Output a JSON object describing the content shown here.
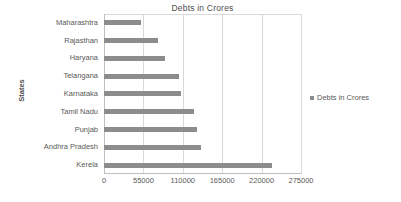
{
  "chart_data": {
    "type": "bar",
    "orientation": "horizontal",
    "title": "Debts in Crores",
    "xlabel": "",
    "ylabel": "States",
    "categories": [
      "Maharashtra",
      "Rajasthan",
      "Haryana",
      "Telangana",
      "Karnataka",
      "Tamil Nadu",
      "Punjab",
      "Andhra Pradesh",
      "Kerela"
    ],
    "values": [
      52000,
      75000,
      85000,
      105000,
      108000,
      125000,
      130000,
      135000,
      235000
    ],
    "series": [
      {
        "name": "Debts in Crores",
        "values": [
          52000,
          75000,
          85000,
          105000,
          108000,
          125000,
          130000,
          135000,
          235000
        ],
        "color": "#8c8c8c"
      }
    ],
    "xlim": [
      0,
      275000
    ],
    "x_ticks": [
      0,
      55000,
      110000,
      165000,
      220000,
      275000
    ],
    "x_tick_labels": [
      "0",
      "55000",
      "110000",
      "165000",
      "220000",
      "275000"
    ],
    "grid": true,
    "grid_color": "#d9d9d9",
    "legend": {
      "position": "right",
      "entries": [
        "Debts in Crores"
      ]
    },
    "plot_background": "#ffffff",
    "text_color": "#595959"
  }
}
